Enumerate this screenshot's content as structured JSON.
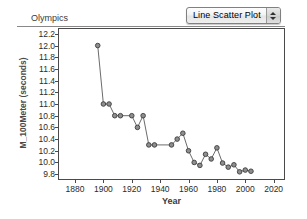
{
  "toolbar": {
    "plot_type_label": "Line Scatter Plot",
    "stepper_up_icon": "triangle-up-icon",
    "stepper_down_icon": "triangle-down-icon"
  },
  "chart_data": {
    "type": "line",
    "title": "Olympics",
    "xlabel": "Year",
    "ylabel": "M_100Meter (seconds)",
    "xlim": [
      1868,
      2028
    ],
    "ylim": [
      9.7,
      12.3
    ],
    "grid": false,
    "legend": null,
    "xticks": [
      1880,
      1900,
      1920,
      1940,
      1960,
      1980,
      2000,
      2020
    ],
    "yticks": [
      9.8,
      10.0,
      10.2,
      10.4,
      10.6,
      10.8,
      11.0,
      11.2,
      11.4,
      11.6,
      11.8,
      12.0,
      12.2
    ],
    "marker": "circle",
    "series": [
      {
        "name": "M_100Meter",
        "x": [
          1896,
          1900,
          1904,
          1908,
          1912,
          1920,
          1924,
          1928,
          1932,
          1936,
          1948,
          1952,
          1956,
          1960,
          1964,
          1968,
          1972,
          1976,
          1980,
          1984,
          1988,
          1992,
          1996,
          2000,
          2004
        ],
        "y": [
          12.0,
          11.0,
          11.0,
          10.8,
          10.8,
          10.8,
          10.6,
          10.8,
          10.3,
          10.3,
          10.3,
          10.4,
          10.5,
          10.2,
          10.0,
          9.95,
          10.14,
          10.06,
          10.25,
          9.99,
          9.92,
          9.96,
          9.84,
          9.87,
          9.85
        ]
      }
    ]
  }
}
